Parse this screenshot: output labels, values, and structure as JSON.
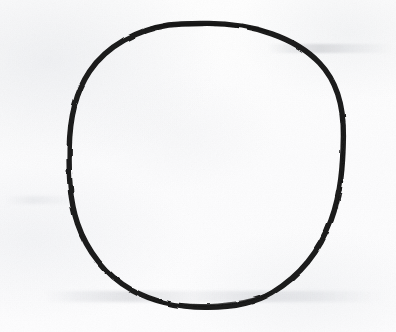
{
  "image": {
    "kind": "scanned-drawing",
    "subject": "hand-drawn circle outline",
    "width": 396,
    "height": 332,
    "background_color": "#fdfdfd",
    "ink_color": "#1a1a1a"
  },
  "drawing": {
    "shape_name": "circle",
    "stroke_style": "freehand ink outline, continuous, slightly irregular",
    "stroke_color": "#1a1a1a",
    "stroke_width_px": 5.4,
    "fill": "none",
    "center_x": 206,
    "center_y": 165,
    "radius_x": 137,
    "radius_y": 142,
    "bounds": {
      "left": 69,
      "top": 23,
      "right": 343,
      "bottom": 307
    }
  },
  "artifacts": {
    "paper_texture": "faint grayish mottling from scan",
    "marks": [
      {
        "name": "smudge-top-right",
        "description": "faint horizontal streak upper right"
      },
      {
        "name": "smudge-bottom",
        "description": "faint horizontal streak band across lower area"
      },
      {
        "name": "smudge-mid-left",
        "description": "faint horizontal streak mid left margin"
      }
    ]
  }
}
